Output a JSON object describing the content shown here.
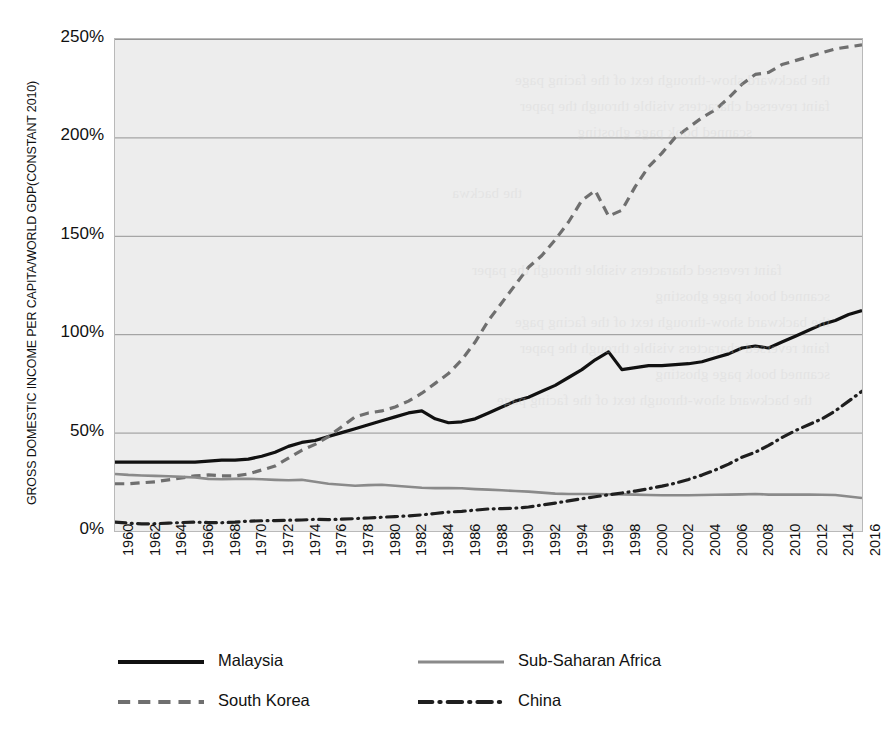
{
  "chart_data": {
    "type": "line",
    "title": "",
    "subtitle": "",
    "xlabel": "",
    "ylabel": "GROSS DOMESTIC INCOME PER CAPITA/WORLD GDP(CONSTANT 2010)",
    "xlim": [
      1960,
      2016
    ],
    "ylim": [
      0,
      250
    ],
    "y_tick_format": "percent",
    "y_ticks": [
      0,
      50,
      100,
      150,
      200,
      250
    ],
    "y_tick_labels": [
      "0%",
      "50%",
      "100%",
      "150%",
      "200%",
      "250%"
    ],
    "x_ticks": [
      1960,
      1962,
      1964,
      1966,
      1968,
      1970,
      1972,
      1974,
      1976,
      1978,
      1980,
      1982,
      1984,
      1986,
      1988,
      1990,
      1992,
      1994,
      1996,
      1998,
      2000,
      2002,
      2004,
      2006,
      2008,
      2010,
      2012,
      2014,
      2016
    ],
    "x_tick_labels": [
      "1960",
      "1962",
      "1964",
      "1966",
      "1968",
      "1970",
      "1972",
      "1974",
      "1976",
      "1978",
      "1980",
      "1982",
      "1984",
      "1986",
      "1988",
      "1990",
      "1992",
      "1994",
      "1996",
      "1998",
      "2000",
      "2002",
      "2004",
      "2006",
      "2008",
      "2010",
      "2012",
      "2014",
      "2016"
    ],
    "x_tick_rotation": -90,
    "grid": {
      "horizontal": true,
      "vertical": false,
      "color": "#8a8a8a"
    },
    "plot_background": "#ededed",
    "legend": {
      "position": "bottom",
      "columns": 2
    },
    "x": [
      1960,
      1961,
      1962,
      1963,
      1964,
      1965,
      1966,
      1967,
      1968,
      1969,
      1970,
      1971,
      1972,
      1973,
      1974,
      1975,
      1976,
      1977,
      1978,
      1979,
      1980,
      1981,
      1982,
      1983,
      1984,
      1985,
      1986,
      1987,
      1988,
      1989,
      1990,
      1991,
      1992,
      1993,
      1994,
      1995,
      1996,
      1997,
      1998,
      1999,
      2000,
      2001,
      2002,
      2003,
      2004,
      2005,
      2006,
      2007,
      2008,
      2009,
      2010,
      2011,
      2012,
      2013,
      2014,
      2015,
      2016
    ],
    "series": [
      {
        "name": "Malaysia",
        "style": "solid",
        "color": "#111111",
        "width": 3.2,
        "values": [
          35,
          35,
          35,
          35,
          35,
          35,
          35,
          35.5,
          36,
          36,
          36.5,
          38,
          40,
          43,
          45,
          46,
          48,
          50,
          52,
          54,
          56,
          58,
          60,
          61,
          57,
          55,
          55.5,
          57,
          60,
          63,
          66,
          68,
          71,
          74,
          78,
          82,
          87,
          91,
          82,
          83,
          84,
          84,
          84.5,
          85,
          86,
          88,
          90,
          93,
          94,
          93,
          96,
          99,
          102,
          105,
          107,
          110,
          112
        ]
      },
      {
        "name": "South Korea",
        "style": "dashed",
        "color": "#6f6f6f",
        "width": 3.2,
        "values": [
          24,
          24,
          24.5,
          25,
          26,
          27,
          28,
          28.5,
          28,
          28,
          29,
          31,
          33,
          37,
          41,
          44,
          48,
          53,
          58,
          60,
          61,
          63,
          66,
          70,
          75,
          80,
          87,
          96,
          107,
          116,
          125,
          134,
          140,
          148,
          157,
          168,
          173,
          160,
          163,
          175,
          185,
          192,
          200,
          205,
          210,
          214,
          220,
          227,
          232,
          233,
          237,
          239,
          241,
          243,
          245,
          246,
          247
        ]
      },
      {
        "name": "Sub-Saharan Africa",
        "style": "solid",
        "color": "#8a8a8a",
        "width": 2.6,
        "values": [
          29,
          28.5,
          28.2,
          28,
          27.8,
          27.5,
          27.2,
          26.5,
          26.3,
          26.5,
          26.5,
          26.3,
          26,
          25.8,
          26,
          25,
          24,
          23.5,
          23,
          23.3,
          23.5,
          23,
          22.5,
          22,
          21.8,
          21.8,
          21.7,
          21.3,
          21,
          20.7,
          20.3,
          20,
          19.5,
          19,
          18.8,
          18.8,
          18.8,
          18.7,
          18.6,
          18.5,
          18.3,
          18.2,
          18.2,
          18.2,
          18.3,
          18.4,
          18.5,
          18.6,
          18.8,
          18.5,
          18.5,
          18.5,
          18.5,
          18.4,
          18.3,
          17.5,
          16.8
        ]
      },
      {
        "name": "China",
        "style": "dashdot",
        "color": "#1f1f1f",
        "width": 3.2,
        "values": [
          4.5,
          4,
          3.6,
          3.7,
          4,
          4.3,
          4.5,
          4.3,
          4.2,
          4.5,
          5,
          5.2,
          5.3,
          5.5,
          5.6,
          5.9,
          5.8,
          6,
          6.3,
          6.6,
          7,
          7.3,
          7.7,
          8.2,
          8.9,
          9.6,
          10,
          10.6,
          11.2,
          11.4,
          11.6,
          12.2,
          13.2,
          14.2,
          15.3,
          16.4,
          17.4,
          18.4,
          19.3,
          20.3,
          21.5,
          22.8,
          24.3,
          26.2,
          28.4,
          31,
          34,
          37.5,
          40,
          43.5,
          47.5,
          51,
          54,
          57,
          61,
          66,
          71
        ]
      }
    ]
  },
  "axis": {
    "y_title": "GROSS DOMESTIC INCOME PER CAPITA/WORLD GDP(CONSTANT 2010)"
  },
  "legend": {
    "items": [
      {
        "label": "Malaysia",
        "style": "solid",
        "color": "#111111"
      },
      {
        "label": "Sub-Saharan Africa",
        "style": "solid",
        "color": "#8a8a8a"
      },
      {
        "label": "South Korea",
        "style": "dashed",
        "color": "#6f6f6f"
      },
      {
        "label": "China",
        "style": "dashdot",
        "color": "#1f1f1f"
      }
    ]
  },
  "background_bleed": [
    "the backward show-through text of the facing page",
    "faint reversed characters visible through the paper",
    "scanned book page ghosting"
  ]
}
